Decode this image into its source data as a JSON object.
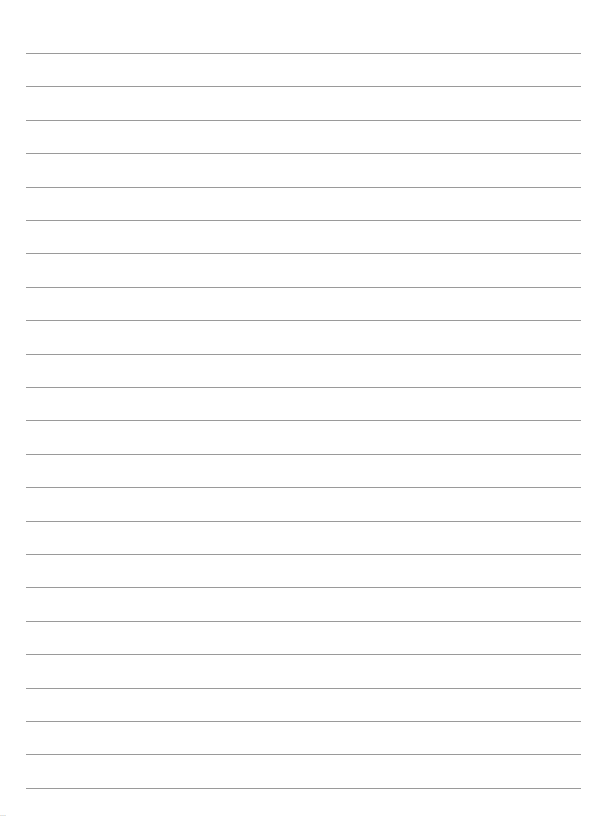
{
  "page": {
    "type": "blank lined paper",
    "line_count": 23,
    "line_color": "#9a9a9a",
    "background": "#ffffff"
  },
  "footer": {
    "text": "..."
  }
}
